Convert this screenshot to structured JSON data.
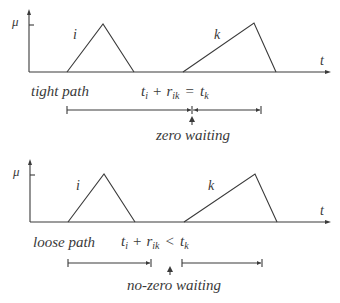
{
  "diagrams": [
    {
      "id": "tight",
      "axis": {
        "y_label": "μ",
        "x_label": "t"
      },
      "triangles": [
        {
          "label": "i"
        },
        {
          "label": "k"
        }
      ],
      "path_label": "tight path",
      "equation": {
        "t": "t",
        "i_sub": "i",
        "plus": "+",
        "r": "r",
        "ik_sub": "ik",
        "op": "=",
        "t2": "t",
        "k_sub": "k"
      },
      "waiting_label": "zero waiting"
    },
    {
      "id": "loose",
      "axis": {
        "y_label": "μ",
        "x_label": "t"
      },
      "triangles": [
        {
          "label": "i"
        },
        {
          "label": "k"
        }
      ],
      "path_label": "loose path",
      "equation": {
        "t": "t",
        "i_sub": "i",
        "plus": "+",
        "r": "r",
        "ik_sub": "ik",
        "op": "<",
        "t2": "t",
        "k_sub": "k"
      },
      "waiting_label": "no-zero waiting"
    }
  ],
  "colors": {
    "ink": "#3a3a3a",
    "background": "#ffffff"
  }
}
